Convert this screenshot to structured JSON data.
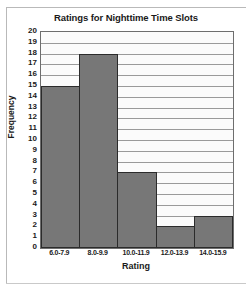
{
  "chart_data": {
    "type": "bar",
    "title": "Ratings for Nighttime Time Slots",
    "xlabel": "Rating",
    "ylabel": "Frequency",
    "categories": [
      "6.0-7.9",
      "8.0-9.9",
      "10.0-11.9",
      "12.0-13.9",
      "14.0-15.9"
    ],
    "values": [
      15,
      18,
      7,
      2,
      3
    ],
    "ylim": [
      0,
      20
    ],
    "ytick_step": 1,
    "yticks": [
      20,
      19,
      18,
      17,
      16,
      15,
      14,
      13,
      12,
      11,
      10,
      9,
      8,
      7,
      6,
      5,
      4,
      3,
      2,
      1,
      0
    ],
    "grid": true,
    "grid_axis": "y",
    "legend": null,
    "colors": {
      "bar_fill": "#777777",
      "bar_edge": "#2b2b2b",
      "plot_background": "#fbfbfb",
      "gridline": "#9a9a9a",
      "axis": "#6e6e6e",
      "text": "#1a1a1a",
      "frame": "#b9b9b9"
    }
  }
}
